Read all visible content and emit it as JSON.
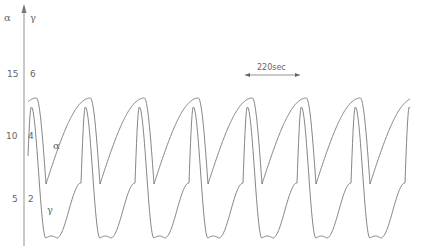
{
  "chart_data": {
    "type": "line",
    "title": "",
    "xlabel": "time",
    "ylabel_left": "α",
    "ylabel_right": "γ",
    "grid": false,
    "legend": "inline curve labels",
    "left_axis": {
      "symbol": "α",
      "ticks": [
        {
          "label": "15",
          "value": 15
        },
        {
          "label": "10",
          "value": 10
        },
        {
          "label": "5",
          "value": 5
        }
      ]
    },
    "right_axis": {
      "symbol": "γ",
      "ticks": [
        {
          "label": "6",
          "value": 6
        },
        {
          "label": "4",
          "value": 4
        },
        {
          "label": "2",
          "value": 2
        }
      ]
    },
    "scale_bar": {
      "label": "220sec",
      "seconds": 220
    },
    "period_seconds": 220,
    "cycles_shown": 7.3,
    "series": [
      {
        "name": "α",
        "axis": "left",
        "shape": "slow rise, fast fall (relaxation)",
        "peak": 13.0,
        "trough": 6.4
      },
      {
        "name": "γ",
        "axis": "right",
        "shape": "sharp spike then deep trough",
        "peak": 4.9,
        "trough": 0.4
      }
    ],
    "ylim_left": [
      2,
      17
    ],
    "ylim_right": [
      0,
      7
    ],
    "annotations": [
      "220sec",
      "α",
      "γ",
      "4",
      "2"
    ]
  },
  "labels": {
    "alpha_axis": "α",
    "gamma_axis": "γ",
    "t15": "15",
    "t6": "6",
    "t10": "10",
    "t4": "4",
    "t5": "5",
    "t2": "2",
    "alpha_curve": "α",
    "gamma_curve": "γ",
    "scale": "220sec"
  }
}
